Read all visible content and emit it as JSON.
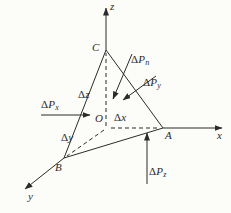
{
  "figure": {
    "background_color": "#fcfcf9",
    "ink_color": "#2b2b2b",
    "axes": {
      "x": "x",
      "y": "y",
      "z": "z"
    },
    "vertices": {
      "origin": "O",
      "a": "A",
      "b": "B",
      "c": "C"
    },
    "dims": {
      "dx": {
        "delta": "Δ",
        "var": "x"
      },
      "dy": {
        "delta": "Δ",
        "var": "y"
      },
      "dz": {
        "delta": "Δ",
        "var": "z"
      }
    },
    "forces": {
      "px": {
        "delta": "Δ",
        "symbol": "P",
        "sub": "x"
      },
      "py": {
        "delta": "Δ",
        "symbol": "P",
        "sub": "y"
      },
      "pz": {
        "delta": "Δ",
        "symbol": "P",
        "sub": "z"
      },
      "pn": {
        "delta": "Δ",
        "symbol": "P",
        "sub": "n"
      }
    }
  }
}
